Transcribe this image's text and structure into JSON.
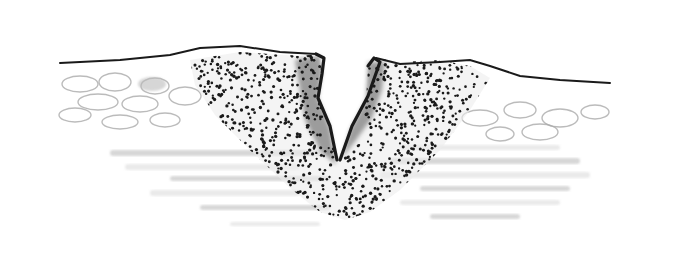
{
  "figure": {
    "style": "pen-and-ink stipple drawing",
    "colors": {
      "background": "#ffffff",
      "ink": "#1a1a1a",
      "wash": "#b8b8b8",
      "light_wash": "#d9d9d9"
    }
  }
}
